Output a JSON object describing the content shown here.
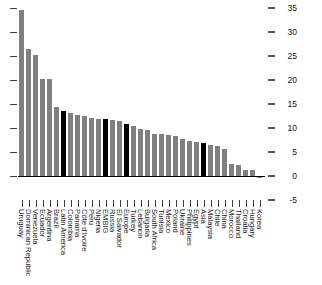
{
  "chart_data": {
    "type": "bar",
    "title": "",
    "subtitle": "",
    "xlabel": "",
    "ylabel": "",
    "ylim": [
      -5,
      35
    ],
    "yticks": [
      35,
      30,
      25,
      20,
      15,
      10,
      5,
      0,
      -5
    ],
    "grid": false,
    "legend_position": "none",
    "axis_position": "right",
    "highlight_color": "#000000",
    "bar_color": "#808080",
    "highlight_categories": [
      "Latin America",
      "EMBIG",
      "Europe",
      "Asia"
    ],
    "categories": [
      "Uruguay",
      "Dominican Republic",
      "Venezuela",
      "Ecuador",
      "Argentina",
      "Brazil",
      "Latin America",
      "Colombia",
      "Panama",
      "Côte d'Ivoire",
      "Peru",
      "Nigeria",
      "EMBIG",
      "Russia",
      "El Salvador",
      "Europe",
      "Turkey",
      "Lebanon",
      "Bulgaria",
      "South Africa",
      "Tunisia",
      "Mexico",
      "Poland",
      "Ukraine",
      "Philippines",
      "Egypt",
      "Asia",
      "Malaysia",
      "Chile",
      "China",
      "Morocco",
      "Thailand",
      "Croatia",
      "Hungary",
      "Korea"
    ],
    "values": [
      34.5,
      26.4,
      25.2,
      20.2,
      20.2,
      14.3,
      13.5,
      13.2,
      12.8,
      12.4,
      12.0,
      11.8,
      11.8,
      11.6,
      11.5,
      10.8,
      10.4,
      9.8,
      9.6,
      8.8,
      8.7,
      8.6,
      8.4,
      7.8,
      7.2,
      7.1,
      6.9,
      6.4,
      6.3,
      5.6,
      2.5,
      2.2,
      1.3,
      1.3,
      -0.4
    ],
    "series": [
      {
        "name": "Value",
        "values": [
          34.5,
          26.4,
          25.2,
          20.2,
          20.2,
          14.3,
          13.5,
          13.2,
          12.8,
          12.4,
          12.0,
          11.8,
          11.8,
          11.6,
          11.5,
          10.8,
          10.4,
          9.8,
          9.6,
          8.8,
          8.7,
          8.6,
          8.4,
          7.8,
          7.2,
          7.1,
          6.9,
          6.4,
          6.3,
          5.6,
          2.5,
          2.2,
          1.3,
          1.3,
          -0.4
        ]
      }
    ]
  }
}
